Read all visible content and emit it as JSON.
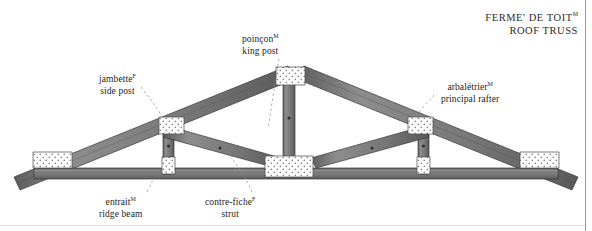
{
  "title": {
    "fr": "FERME",
    "fr_accent": "'",
    "fr_rest": " DE TOIT",
    "fr_sup": "M",
    "en": "ROOF TRUSS",
    "fr_full": "FERME' DE TOIT",
    "line1": "FERME' DE TOIT",
    "line2": "ROOF TRUSS"
  },
  "labels": {
    "king_post": {
      "fr": "poinçon",
      "sup": "M",
      "en": "king post"
    },
    "side_post": {
      "fr": "jambette",
      "sup": "F",
      "en": "side post"
    },
    "principal_rafter": {
      "fr": "arbalétrier",
      "sup": "M",
      "en": "principal rafter"
    },
    "ridge_beam": {
      "fr": "entrait",
      "sup": "M",
      "en": "ridge beam"
    },
    "strut": {
      "fr": "contre-fiche",
      "sup": "F",
      "en": "strut"
    }
  },
  "colors": {
    "timber_fill": "#7b7b7b",
    "timber_edge": "#3d3d3d",
    "joint_fill": "#ffffff",
    "joint_edge": "#4a4a4a",
    "stipple": "#7a7a7a",
    "leader": "#8c8c8c",
    "text": "#1d1d1d",
    "frame": "#9a9a9a",
    "background": "#ffffff"
  },
  "diagram": {
    "type": "technical-illustration",
    "members": [
      {
        "name": "bottom-chord",
        "label_key": "ridge_beam"
      },
      {
        "name": "left-principal-rafter",
        "label_key": "principal_rafter"
      },
      {
        "name": "right-principal-rafter",
        "label_key": "principal_rafter"
      },
      {
        "name": "king-post",
        "label_key": "king_post"
      },
      {
        "name": "left-side-post",
        "label_key": "side_post"
      },
      {
        "name": "right-side-post",
        "label_key": "side_post"
      },
      {
        "name": "left-strut",
        "label_key": "strut"
      },
      {
        "name": "right-strut",
        "label_key": "strut"
      }
    ],
    "joint_blocks": [
      "left-eave-gusset",
      "left-sidepost-top-gusset",
      "left-sidepost-bottom-gusset",
      "apex-gusset",
      "center-bottom-gusset",
      "right-sidepost-top-gusset",
      "right-sidepost-bottom-gusset",
      "right-eave-gusset"
    ]
  }
}
